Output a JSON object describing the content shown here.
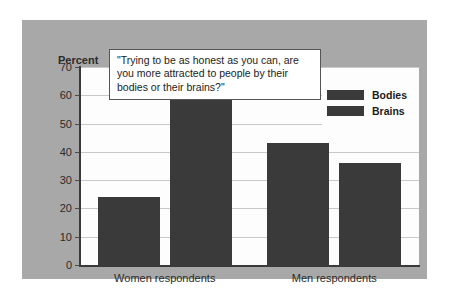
{
  "chart_data": {
    "type": "bar",
    "title": "\"Trying to be as honest as you can, are you more attracted to people by their bodies or their brains?\"",
    "xlabel": "",
    "ylabel": "Percent",
    "ylim": [
      0,
      70
    ],
    "yticks": [
      0,
      10,
      20,
      30,
      40,
      50,
      60,
      70
    ],
    "ytick_labels": [
      "0",
      "10",
      "20",
      "30",
      "40",
      "50",
      "60",
      "70"
    ],
    "categories": [
      "Women respondents",
      "Men respondents"
    ],
    "series": [
      {
        "name": "Bodies",
        "values": [
          24,
          43
        ],
        "color": "#3a3a3a"
      },
      {
        "name": "Brains",
        "values": [
          60,
          36
        ],
        "color": "#3a3a3a"
      }
    ],
    "legend_position": "upper-right",
    "grid": true,
    "grid_axis": "y",
    "panel_color": "#a8a8a8",
    "plot_background": "#fdfdfd"
  },
  "legend": {
    "entries": [
      {
        "label": "Bodies"
      },
      {
        "label": "Brains"
      }
    ]
  },
  "axis": {
    "y_title": "Percent"
  }
}
